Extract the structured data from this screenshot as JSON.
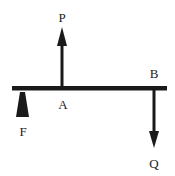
{
  "diagram": {
    "labels": {
      "P": "P",
      "A": "A",
      "B": "B",
      "F": "F",
      "Q": "Q"
    },
    "colors": {
      "ink": "#1a1a1a",
      "background": "#ffffff"
    }
  }
}
